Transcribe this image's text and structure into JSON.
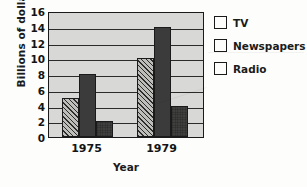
{
  "chart_data": {
    "type": "bar",
    "title": "",
    "xlabel": "Year",
    "ylabel": "Billions of dollars",
    "categories": [
      "1975",
      "1979"
    ],
    "series": [
      {
        "name": "TV",
        "values": [
          5,
          10
        ],
        "pattern": "diagonal-hatch",
        "color": "#bdbdba"
      },
      {
        "name": "Newspapers",
        "values": [
          8,
          14
        ],
        "pattern": "solid",
        "color": "#3b3b3b"
      },
      {
        "name": "Radio",
        "values": [
          2,
          3.9
        ],
        "pattern": "stipple",
        "color": "#3f3f3f"
      }
    ],
    "ylim": [
      0,
      16
    ],
    "yticks": [
      0,
      2,
      4,
      6,
      8,
      10,
      12,
      14,
      16
    ],
    "ytick_labels": [
      "0",
      "2",
      "4",
      "6",
      "8",
      "10",
      "12",
      "14",
      "16"
    ],
    "grid": true,
    "grid_axis": "y",
    "legend_position": "right",
    "plot_background": "#d8d8d6",
    "axis_color": "#1a1a1a"
  },
  "legend": {
    "items": [
      {
        "label": "TV"
      },
      {
        "label": "Newspapers"
      },
      {
        "label": "Radio"
      }
    ]
  },
  "axes": {
    "y_title": "Billions of dollars",
    "x_title": "Year"
  }
}
